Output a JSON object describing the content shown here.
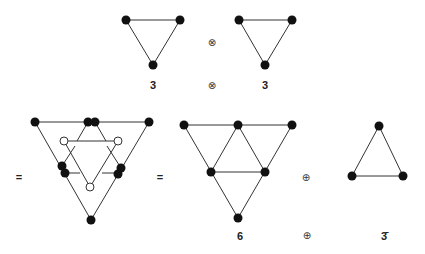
{
  "diagram": {
    "top_row": {
      "left_label": "3",
      "operator": "⊗",
      "right_label": "3"
    },
    "bottom_row": {
      "equals_1": "=",
      "equals_2": "=",
      "operator": "⊕",
      "label_sum_left": "6",
      "label_sum_op": "⊕",
      "label_sum_right": "3̄"
    },
    "colors": {
      "line": "#333333",
      "node_fill": "#111111",
      "hollow_node_fill": "#ffffff"
    }
  }
}
